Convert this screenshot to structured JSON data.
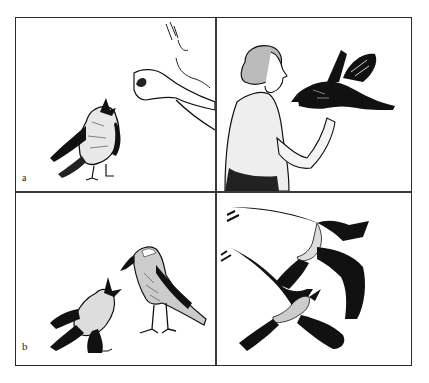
{
  "figure": {
    "panels": [
      {
        "id": "a-left",
        "label": "a",
        "description": "A young crow with open beak begging toward a human hand above it"
      },
      {
        "id": "a-right",
        "label": "",
        "description": "A woman holding a crow with spread tail on her hand"
      },
      {
        "id": "b-left",
        "label": "b",
        "description": "A young crow begging from an adult hooded crow standing beside it"
      },
      {
        "id": "b-right",
        "label": "",
        "description": "Two crows in flight with spread wings"
      }
    ],
    "caption": "",
    "colors": {
      "ink": "#111111",
      "border": "#2a2a2a",
      "paper": "#ffffff"
    }
  }
}
